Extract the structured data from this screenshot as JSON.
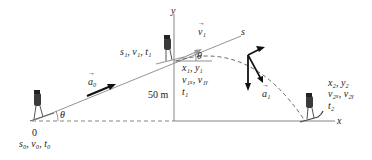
{
  "diagram": {
    "axes": {
      "y_label": "y",
      "x_label": "x",
      "s_label": "s"
    },
    "height_label": "50 m",
    "angle_label": "θ",
    "origin_label": "0",
    "points": {
      "start": {
        "line1": "s₀, v₀, t₀"
      },
      "takeoff_upper": {
        "line1": "s₁, v₁, t₁"
      },
      "takeoff_lower": {
        "line1": "x₁, y₁",
        "line2": "v₁ₓ, v₁ᵧ",
        "line3": "t₁"
      },
      "landing": {
        "line1": "x₂, y₂",
        "line2": "v₂ₓ, v₂ᵧ",
        "line3": "t₂"
      }
    },
    "vectors": {
      "a0": "a₀",
      "v1": "v₁",
      "a1": "a₁"
    },
    "colors": {
      "line": "#777777",
      "dash": "#555555",
      "arrow": "#111111",
      "skier_body": "#3a3a3a"
    }
  }
}
